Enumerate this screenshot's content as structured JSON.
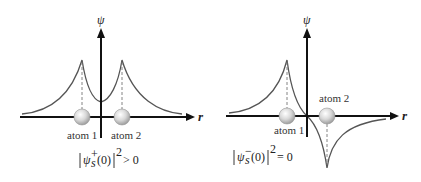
{
  "diagrams": [
    {
      "id": "bonding",
      "y_axis_label": "ψ",
      "x_axis_label": "r",
      "atoms": [
        {
          "label": "atom 1"
        },
        {
          "label": "atom 2"
        }
      ],
      "formula": {
        "psi": "ψ",
        "sub": "s",
        "sup": "+",
        "arg": "(0)",
        "power": "2",
        "relation": "> 0"
      }
    },
    {
      "id": "antibonding",
      "y_axis_label": "ψ",
      "x_axis_label": "r",
      "atoms": [
        {
          "label": "atom 1"
        },
        {
          "label": "atom 2"
        }
      ],
      "formula": {
        "psi": "ψ",
        "sub": "s",
        "sup": "−",
        "arg": "(0)",
        "power": "2",
        "relation": "= 0"
      }
    }
  ],
  "colors": {
    "axis": "#111111",
    "curve": "#555555",
    "dash": "#777777",
    "atom_fill": "#d9d9d9",
    "atom_stroke": "#9a9a9a"
  }
}
